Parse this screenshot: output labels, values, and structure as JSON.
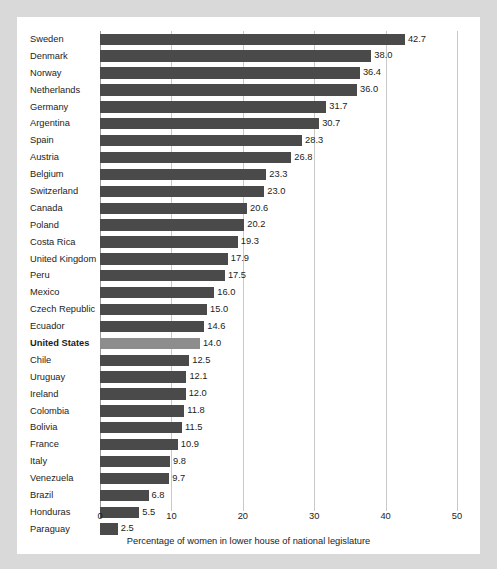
{
  "chart_data": {
    "type": "bar",
    "orientation": "horizontal",
    "title": "",
    "xlabel": "Percentage of women in lower house of national legislature",
    "ylabel": "",
    "xlim": [
      0,
      50
    ],
    "xticks": [
      0,
      10,
      20,
      30,
      40,
      50
    ],
    "xtick_labels": [
      "0",
      "10",
      "20",
      "30",
      "40",
      "50"
    ],
    "grid": "vertical",
    "legend": "none",
    "highlight_category": "United States",
    "colors": {
      "bar": "#4a4a4a",
      "bar_highlight": "#8d8d8d",
      "gridline": "#c9c9c9",
      "axis": "#9a9a9a",
      "card_background": "#ffffff",
      "page_background": "#d9d9d9",
      "text": "#1c1c1c"
    },
    "categories": [
      "Sweden",
      "Denmark",
      "Norway",
      "Netherlands",
      "Germany",
      "Argentina",
      "Spain",
      "Austria",
      "Belgium",
      "Switzerland",
      "Canada",
      "Poland",
      "Costa Rica",
      "United Kingdom",
      "Peru",
      "Mexico",
      "Czech Republic",
      "Ecuador",
      "United States",
      "Chile",
      "Uruguay",
      "Ireland",
      "Colombia",
      "Bolivia",
      "France",
      "Italy",
      "Venezuela",
      "Brazil",
      "Honduras",
      "Paraguay"
    ],
    "values": [
      42.7,
      38.0,
      36.4,
      36.0,
      31.7,
      30.7,
      28.3,
      26.8,
      23.3,
      23.0,
      20.6,
      20.2,
      19.3,
      17.9,
      17.5,
      16.0,
      15.0,
      14.6,
      14.0,
      12.5,
      12.1,
      12.0,
      11.8,
      11.5,
      10.9,
      9.8,
      9.7,
      6.8,
      5.5,
      2.5
    ],
    "value_labels": [
      "42.7",
      "38.0",
      "36.4",
      "36.0",
      "31.7",
      "30.7",
      "28.3",
      "26.8",
      "23.3",
      "23.0",
      "20.6",
      "20.2",
      "19.3",
      "17.9",
      "17.5",
      "16.0",
      "15.0",
      "14.6",
      "14.0",
      "12.5",
      "12.1",
      "12.0",
      "11.8",
      "11.5",
      "10.9",
      "9.8",
      "9.7",
      "6.8",
      "5.5",
      "2.5"
    ]
  }
}
